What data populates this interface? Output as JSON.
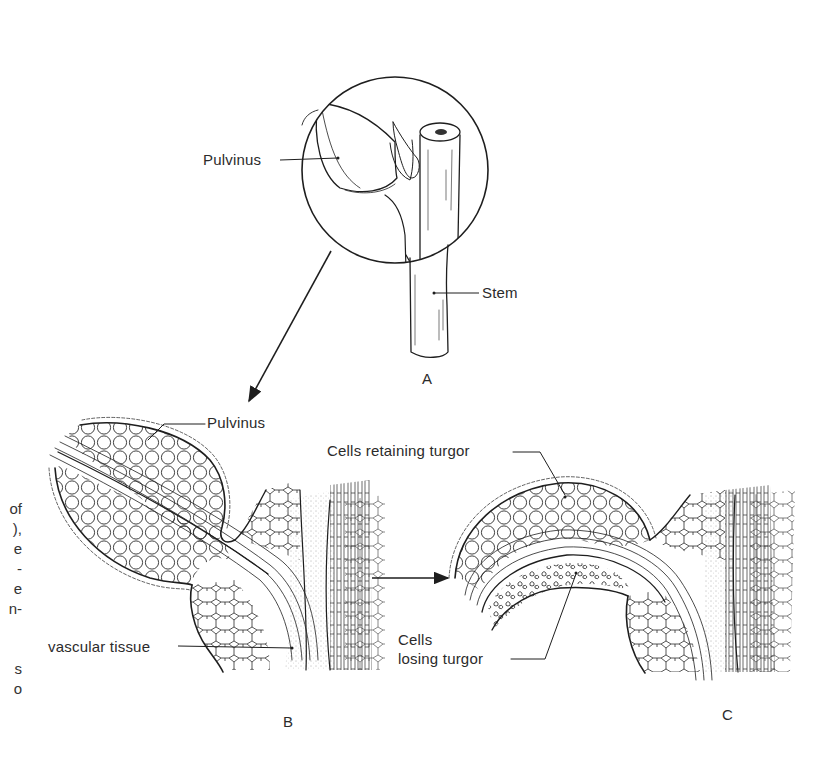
{
  "figure": {
    "panels": [
      {
        "id": "A",
        "letter": "A",
        "description": "Stem with leaf removed, pulvinus shown in magnified circle"
      },
      {
        "id": "B",
        "letter": "B",
        "description": "Longitudinal section of turgid pulvinus"
      },
      {
        "id": "C",
        "letter": "C",
        "description": "Pulvinus section after loss of turgor on lower side"
      }
    ],
    "labels": {
      "a_pulvinus": "Pulvinus",
      "a_stem": "Stem",
      "b_pulvinus": "Pulvinus",
      "b_vascular": "vascular tissue",
      "c_retaining": "Cells retaining turgor",
      "c_losing_line1": "Cells",
      "c_losing_line2": "losing turgor"
    },
    "arrows": [
      {
        "from": "A-magnified-circle",
        "to": "B"
      },
      {
        "from": "B",
        "to": "C"
      }
    ],
    "margin_text_fragments": [
      "of",
      "),",
      "e",
      "-",
      "e",
      "n-",
      "s",
      "o"
    ]
  },
  "colors": {
    "ink": "#1e1e1e",
    "text": "#2b2b2b",
    "background": "#ffffff"
  }
}
